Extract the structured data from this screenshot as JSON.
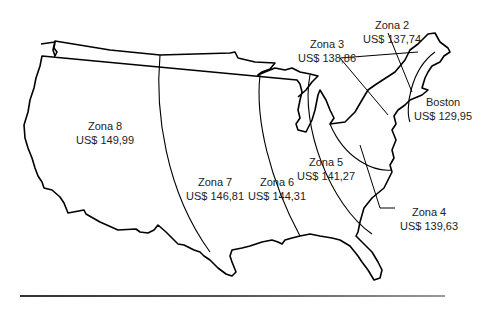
{
  "map": {
    "title": "",
    "zones": [
      {
        "name": "Zona 2",
        "price": "US$ 137,74"
      },
      {
        "name": "Zona 3",
        "price": "US$ 138,86"
      },
      {
        "name": "Boston",
        "price": "US$ 129,95"
      },
      {
        "name": "Zona 5",
        "price": "US$ 141,27"
      },
      {
        "name": "Zona 4",
        "price": "US$ 139,63"
      },
      {
        "name": "Zona 6",
        "price": "US$ 144,31"
      },
      {
        "name": "Zona 7",
        "price": "US$ 146,81"
      },
      {
        "name": "Zona 8",
        "price": "US$ 149,99"
      }
    ],
    "colors": {
      "outline": "#000000",
      "text": "#222222",
      "background": "#ffffff"
    }
  }
}
